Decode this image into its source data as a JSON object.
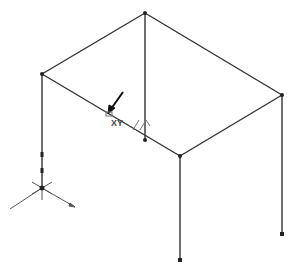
{
  "diagram": {
    "type": "3d-frame-structure",
    "colors": {
      "line": "#333333",
      "node": "#222222",
      "axis": "#555555",
      "background": "#ffffff"
    },
    "nodes": [
      {
        "id": "top-back",
        "x": 145,
        "y": 13
      },
      {
        "id": "left-top",
        "x": 42,
        "y": 74
      },
      {
        "id": "right-top",
        "x": 282,
        "y": 95
      },
      {
        "id": "front-top",
        "x": 180,
        "y": 156
      },
      {
        "id": "back-mid-bottom",
        "x": 145,
        "y": 140
      },
      {
        "id": "left-bottom",
        "x": 42,
        "y": 188
      },
      {
        "id": "front-bottom",
        "x": 180,
        "y": 260
      },
      {
        "id": "right-bottom",
        "x": 282,
        "y": 234
      }
    ],
    "annotation": {
      "label": "XY",
      "symbol": "XY-plane-icon"
    }
  }
}
